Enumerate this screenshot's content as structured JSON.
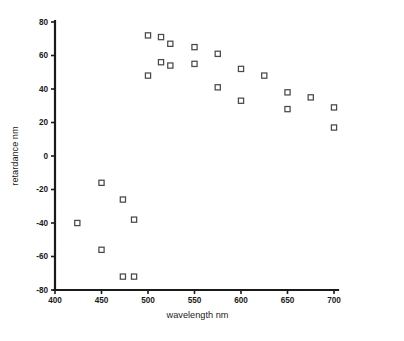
{
  "chart_data": {
    "type": "scatter",
    "title": "",
    "xlabel": "wavelength nm",
    "ylabel": "retardance nm",
    "xlim": [
      400,
      700
    ],
    "ylim": [
      -80,
      80
    ],
    "xticks": [
      400,
      450,
      500,
      550,
      600,
      650,
      700
    ],
    "yticks": [
      80,
      60,
      40,
      20,
      0,
      -20,
      -40,
      -60,
      -80
    ],
    "xtick_labels": [
      "400",
      "450",
      "500",
      "550",
      "600",
      "650",
      "700"
    ],
    "ytick_labels": [
      "80",
      "60",
      "40",
      "20",
      "0",
      "-20",
      "-40",
      "-60",
      "-80"
    ],
    "grid": false,
    "legend": null,
    "marker": "open-square",
    "marker_color": "#4a4a4a",
    "series": [
      {
        "name": "retardance",
        "points": [
          [
            424,
            -40
          ],
          [
            450,
            -16
          ],
          [
            450,
            -56
          ],
          [
            473,
            -26
          ],
          [
            473,
            -72
          ],
          [
            485,
            -38
          ],
          [
            485,
            -72
          ],
          [
            500,
            48
          ],
          [
            500,
            72
          ],
          [
            514,
            56
          ],
          [
            514,
            71
          ],
          [
            524,
            54
          ],
          [
            524,
            67
          ],
          [
            550,
            55
          ],
          [
            550,
            65
          ],
          [
            575,
            41
          ],
          [
            575,
            61
          ],
          [
            600,
            33
          ],
          [
            600,
            52
          ],
          [
            625,
            48
          ],
          [
            650,
            28
          ],
          [
            650,
            38
          ],
          [
            675,
            35
          ],
          [
            700,
            17
          ],
          [
            700,
            29
          ]
        ]
      }
    ]
  },
  "axes": {
    "x_title": "wavelength nm",
    "y_title": "retardance nm"
  }
}
